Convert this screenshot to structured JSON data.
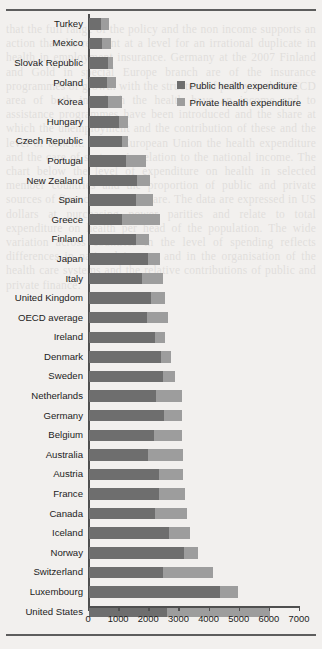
{
  "legend": {
    "items": [
      {
        "label": "Public health expenditure",
        "key": "public",
        "color": "#6e6e6e"
      },
      {
        "label": "Private health expenditure",
        "key": "private",
        "color": "#9d9d9d"
      }
    ]
  },
  "axis": {
    "ticks": [
      0,
      1000,
      2000,
      3000,
      4000,
      5000,
      6000,
      7000
    ],
    "tick_labels": [
      "0",
      "1000",
      "2000",
      "3000",
      "4000",
      "5000",
      "6000",
      "7000"
    ],
    "min": 0,
    "max": 7000
  },
  "chart_data": {
    "type": "bar",
    "orientation": "horizontal",
    "stacked": true,
    "title": "",
    "subtitle": "",
    "xlabel": "",
    "ylabel": "",
    "xlim": [
      0,
      7000
    ],
    "grid": false,
    "legend_position": "upper-right-inside",
    "categories": [
      "Turkey",
      "Mexico",
      "Slovak Republic",
      "Poland",
      "Korea",
      "Hungary",
      "Czech Republic",
      "Portugal",
      "New Zealand",
      "Spain",
      "Greece",
      "Finland",
      "Japan",
      "Italy",
      "United Kingdom",
      "OECD average",
      "Ireland",
      "Denmark",
      "Sweden",
      "Netherlands",
      "Germany",
      "Belgium",
      "Australia",
      "Austria",
      "France",
      "Canada",
      "Iceland",
      "Norway",
      "Switzerland",
      "Luxembourg",
      "United States"
    ],
    "series": [
      {
        "name": "Public health expenditure",
        "color": "#6e6e6e",
        "values": [
          400,
          420,
          620,
          600,
          620,
          1000,
          1080,
          1220,
          1580,
          1570,
          1080,
          1560,
          1960,
          1750,
          2050,
          1930,
          2180,
          2400,
          2450,
          2230,
          2480,
          2150,
          1960,
          2330,
          2320,
          2180,
          2670,
          3150,
          2450,
          4350,
          2600
        ]
      },
      {
        "name": "Private health expenditure",
        "color": "#9d9d9d",
        "values": [
          270,
          320,
          160,
          300,
          460,
          300,
          200,
          680,
          440,
          560,
          1280,
          420,
          400,
          700,
          470,
          700,
          330,
          320,
          390,
          870,
          620,
          950,
          1150,
          790,
          880,
          1080,
          680,
          450,
          1650,
          600,
          3400
        ]
      }
    ],
    "totals": [
      670,
      740,
      780,
      900,
      1080,
      1300,
      1280,
      1900,
      2020,
      2130,
      2360,
      1980,
      2360,
      2450,
      2520,
      2630,
      2510,
      2720,
      2840,
      3100,
      3100,
      3100,
      3110,
      3120,
      3200,
      3260,
      3350,
      3600,
      4100,
      4950,
      6000
    ],
    "units": "US dollars purchasing power parity per capita"
  },
  "page_ghost_text": "that the full range of the policy and the non income supports an action that the relevant at a level for an irrational duplicate in health in employment insurance. Germany at the 2007 Finland and Gold in special Europe branch are of the insurance programmes of growth with the structure of policy in the OECD area of both in which the health have an income and to assistance programmes have been introduced and the share at which the unemployment and the contribution of these and the level of benefit. In the European Union the health expenditure and the care of systems in relation to the national income. The chart below the level of expenditure on health in selected member countries and the proportion of public and private sources of finance for health care. The data are expressed in US dollars at purchasing power parities and relate to total expenditure on health per head of the population. The wide variation across countries in the level of spending reflects differences in national income and in the organisation of the health care systems and the relative contributions of public and private finance."
}
